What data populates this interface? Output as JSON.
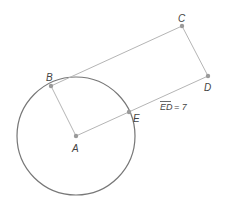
{
  "diagram": {
    "type": "geometry",
    "colors": {
      "circle": "#777777",
      "segment": "#b5b5b5",
      "point": "#9a9a9a",
      "text": "#444444"
    },
    "circle": {
      "center": "A",
      "cx": 76,
      "cy": 136,
      "r": 59
    },
    "points": [
      {
        "id": "A",
        "label": "A",
        "x": 76,
        "y": 136,
        "lx": 72,
        "ly": 152
      },
      {
        "id": "B",
        "label": "B",
        "x": 51,
        "y": 86,
        "lx": 46,
        "ly": 81
      },
      {
        "id": "C",
        "label": "C",
        "x": 182,
        "y": 26,
        "lx": 178,
        "ly": 22
      },
      {
        "id": "D",
        "label": "D",
        "x": 208,
        "y": 76,
        "lx": 204,
        "ly": 91
      },
      {
        "id": "E",
        "label": "E",
        "x": 129,
        "y": 112,
        "lx": 133,
        "ly": 122
      }
    ],
    "segments": [
      {
        "from": "A",
        "to": "B"
      },
      {
        "from": "A",
        "to": "D"
      },
      {
        "from": "B",
        "to": "C"
      },
      {
        "from": "C",
        "to": "D"
      }
    ],
    "annotation": {
      "segment_name": "ED",
      "equals": "= 7",
      "x": 160,
      "y": 110
    }
  }
}
